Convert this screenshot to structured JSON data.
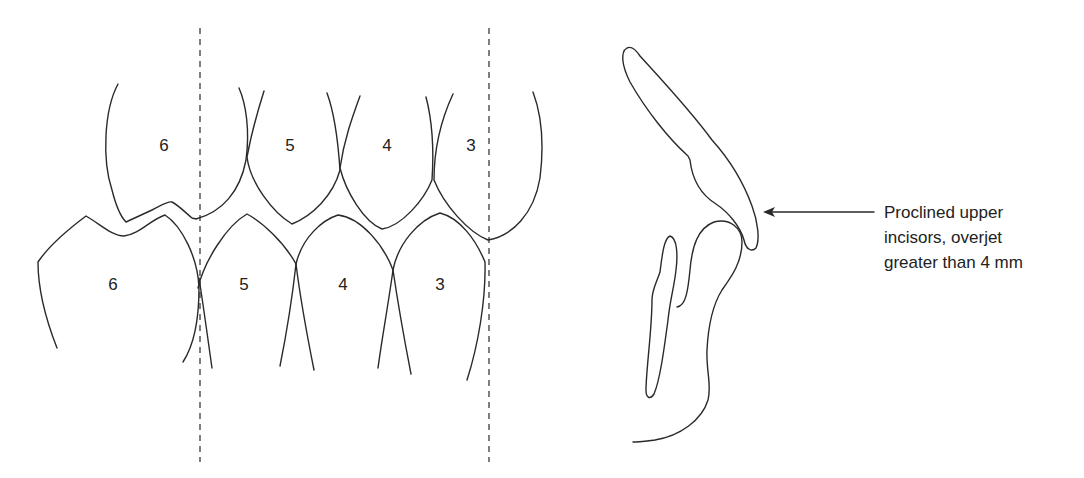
{
  "figure": {
    "colors": {
      "line": "#2a2a2a",
      "background": "#ffffff"
    }
  },
  "buccal_segment": {
    "upper_teeth": [
      {
        "label": "6"
      },
      {
        "label": "5"
      },
      {
        "label": "4"
      },
      {
        "label": "3"
      }
    ],
    "lower_teeth": [
      {
        "label": "6"
      },
      {
        "label": "5"
      },
      {
        "label": "4"
      },
      {
        "label": "3"
      }
    ],
    "reference_lines": [
      "dashed-line-left",
      "dashed-line-right"
    ]
  },
  "incisor_profile": {
    "annotation": {
      "lines": [
        "Proclined upper",
        "incisors, overjet",
        "greater than 4 mm"
      ]
    }
  }
}
